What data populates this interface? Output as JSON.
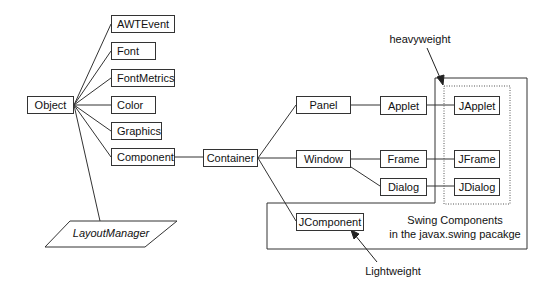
{
  "nodes": {
    "object": "Object",
    "awtevent": "AWTEvent",
    "font": "Font",
    "fontmetrics": "FontMetrics",
    "color": "Color",
    "graphics": "Graphics",
    "component": "Component",
    "container": "Container",
    "panel": "Panel",
    "applet": "Applet",
    "japplet": "JApplet",
    "window": "Window",
    "frame": "Frame",
    "jframe": "JFrame",
    "dialog": "Dialog",
    "jdialog": "JDialog",
    "jcomponent": "JComponent",
    "layoutmanager": "LayoutManager"
  },
  "annotations": {
    "heavyweight": "heavyweight",
    "lightweight": "Lightweight",
    "swing_line1": "Swing Components",
    "swing_line2": "in the javax.swing  pacakge"
  },
  "edges": [
    [
      "Object",
      "AWTEvent"
    ],
    [
      "Object",
      "Font"
    ],
    [
      "Object",
      "FontMetrics"
    ],
    [
      "Object",
      "Color"
    ],
    [
      "Object",
      "Graphics"
    ],
    [
      "Object",
      "Component"
    ],
    [
      "Object",
      "LayoutManager"
    ],
    [
      "Component",
      "Container"
    ],
    [
      "Container",
      "Panel"
    ],
    [
      "Container",
      "Window"
    ],
    [
      "Container",
      "JComponent"
    ],
    [
      "Panel",
      "Applet"
    ],
    [
      "Applet",
      "JApplet"
    ],
    [
      "Window",
      "Frame"
    ],
    [
      "Window",
      "Dialog"
    ],
    [
      "Frame",
      "JFrame"
    ],
    [
      "Dialog",
      "JDialog"
    ]
  ],
  "colors": {
    "stroke": "#333333",
    "text": "#111111",
    "background": "#ffffff"
  }
}
